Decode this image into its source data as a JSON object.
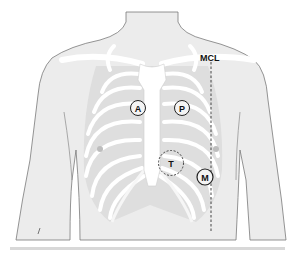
{
  "figure": {
    "type": "anatomical-diagram",
    "colors": {
      "skin": "#e9e9e9",
      "skin_outline": "#7a7a7a",
      "rib_cage": "#dcdcdc",
      "bone": "#ffffff",
      "marker_stroke": "#222222",
      "mcl_line": "#333333"
    }
  },
  "labels": {
    "mcl": "MCL",
    "aortic": "A",
    "pulmonic": "P",
    "tricuspid": "T",
    "mitral": "M"
  }
}
